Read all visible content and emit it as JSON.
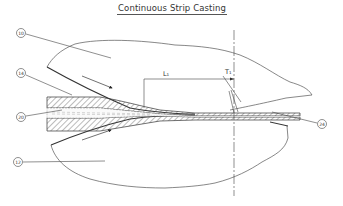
{
  "title": "Continuous Strip Casting",
  "callouts": [
    {
      "id": "upper-roll",
      "label": "10",
      "cx": 21,
      "cy": 33
    },
    {
      "id": "strip",
      "label": "14",
      "cx": 21,
      "cy": 73
    },
    {
      "id": "core",
      "label": "20",
      "cx": 21,
      "cy": 117
    },
    {
      "id": "lower-roll",
      "label": "12",
      "cx": 18,
      "cy": 162
    },
    {
      "id": "output",
      "label": "24",
      "cx": 322,
      "cy": 124
    }
  ],
  "dimensions": {
    "length": "L₁",
    "thickness": "T₁"
  },
  "colors": {
    "line": "#444444",
    "background": "#ffffff"
  }
}
